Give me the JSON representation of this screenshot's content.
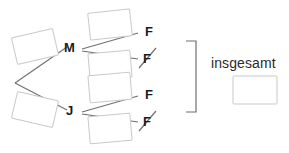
{
  "diagram": {
    "type": "probability-tree"
  },
  "branch_nodes": [
    {
      "id": "m",
      "label": "M"
    },
    {
      "id": "j",
      "label": "J"
    }
  ],
  "outcome_nodes": [
    {
      "id": "m-f",
      "label": "F",
      "negated": false
    },
    {
      "id": "m-not-f",
      "label": "F",
      "negated": true
    },
    {
      "id": "j-f",
      "label": "F",
      "negated": false
    },
    {
      "id": "j-not-f",
      "label": "F",
      "negated": true
    }
  ],
  "answer_boxes": [
    {
      "id": "box-m",
      "value": ""
    },
    {
      "id": "box-j",
      "value": ""
    },
    {
      "id": "box-m-f",
      "value": ""
    },
    {
      "id": "box-m-not-f",
      "value": ""
    },
    {
      "id": "box-j-f",
      "value": ""
    },
    {
      "id": "box-j-not-f",
      "value": ""
    },
    {
      "id": "box-total",
      "value": ""
    }
  ],
  "total": {
    "label": "insgesamt",
    "value": ""
  },
  "bracket": {
    "symbol": "]"
  },
  "colors": {
    "line": "#6f6f6f",
    "box_border": "#c9c9c9",
    "text": "#1b1b1b",
    "background": "#ffffff"
  }
}
